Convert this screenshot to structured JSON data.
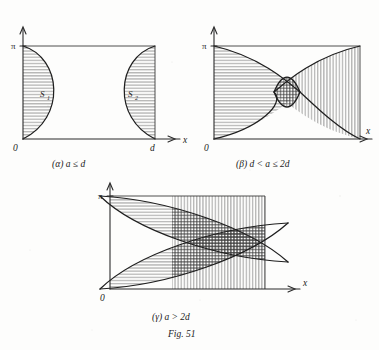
{
  "figure": {
    "number_label": "Fig. 51",
    "panels": [
      {
        "id": "alpha",
        "marker": "(α)",
        "condition": "a ≤ d",
        "caption": "(α)   a ≤ d",
        "y_axis_top_label": "π",
        "origin_label": "0",
        "x_axis_label": "x",
        "x_right_label": "d",
        "regions": [
          {
            "name": "S1",
            "base": "S",
            "subscript": "1",
            "hatching": "horizontal",
            "side": "left"
          },
          {
            "name": "S2",
            "base": "S",
            "subscript": "2",
            "hatching": "horizontal",
            "side": "right"
          }
        ]
      },
      {
        "id": "beta",
        "marker": "(β)",
        "condition": "d < a ≤ 2d",
        "caption": "(β)   d < a ≤ 2d",
        "y_axis_top_label": "π",
        "origin_label": "0",
        "x_axis_label": "x",
        "regions": [
          {
            "name": "S1",
            "hatching": "horizontal",
            "side": "left"
          },
          {
            "name": "S2",
            "hatching": "vertical",
            "side": "right"
          },
          {
            "name": "overlap",
            "hatching": "cross",
            "side": "center"
          }
        ]
      },
      {
        "id": "gamma",
        "marker": "(γ)",
        "condition": "a > 2d",
        "caption": "(γ)   a > 2d",
        "y_axis_top_label": "π",
        "origin_label": "0",
        "x_axis_label": "x",
        "regions": [
          {
            "name": "S1",
            "hatching": "horizontal",
            "side": "left"
          },
          {
            "name": "S2",
            "hatching": "vertical",
            "side": "right"
          },
          {
            "name": "overlap",
            "hatching": "cross",
            "side": "center"
          }
        ]
      }
    ]
  },
  "colors": {
    "ink": "#1f1f1f",
    "hatch": "#3a3a3a",
    "paper": "#fdfdfc"
  }
}
